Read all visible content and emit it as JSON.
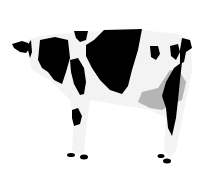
{
  "image": {
    "subject": "Holstein cow",
    "description": "Black and white spotted dairy cow standing in profile, facing left, on a white background",
    "colors": {
      "background": "#ffffff",
      "body": "#f2f2f2",
      "spots": "#000000",
      "udder": "#b5b5b5"
    }
  }
}
